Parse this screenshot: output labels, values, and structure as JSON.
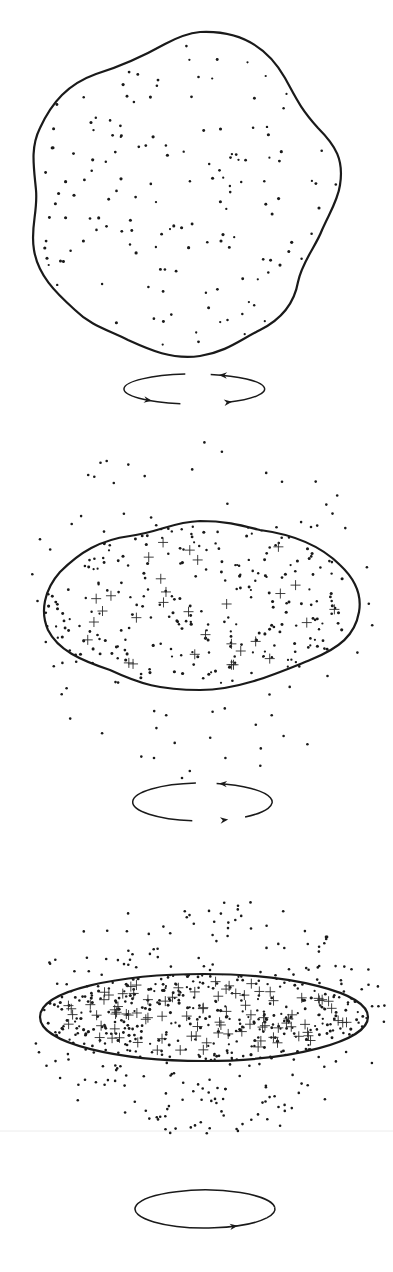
{
  "figure": {
    "colors": {
      "ink": "#1a1a1a",
      "background": "#ffffff",
      "seam": "#ececec"
    },
    "seam_line_y": 1131,
    "stages": [
      {
        "id": "stage-1",
        "label": "irregular rotating cloud",
        "outline_path": "M 200 32 C 240 30 268 48 285 78 C 296 98 300 108 318 128 C 336 146 344 160 340 185 C 338 200 330 212 322 230 C 316 246 302 262 298 282 C 294 305 280 320 260 330 C 240 340 226 352 200 356 C 172 360 150 350 128 340 C 108 330 90 325 75 310 C 55 292 38 275 34 250 C 30 228 38 212 36 190 C 34 168 30 148 40 128 C 52 102 68 84 96 74 C 122 66 140 58 165 44 C 178 37 190 33 200 32 Z",
        "dots": {
          "count": 190,
          "cx": 188,
          "cy": 192,
          "rx": 150,
          "ry": 160,
          "seed": 11,
          "clip": "stage-1"
        },
        "crosses": {
          "count": 0
        },
        "halo": {
          "count": 0
        },
        "rotation": {
          "cx": 195,
          "cy": 389,
          "rx": 70,
          "ry": 15,
          "arrows": [
            "left-top",
            "bottom-left",
            "bottom-right"
          ]
        }
      },
      {
        "id": "stage-2",
        "label": "flattening cloud with forming stars",
        "outline_path": "M 200 521 C 225 521 240 525 260 530 C 290 534 320 545 340 565 C 356 580 362 595 359 612 C 355 635 340 648 310 660 C 280 672 240 690 200 690 C 160 690 140 684 110 670 C 80 660 58 650 48 630 C 40 612 44 590 60 572 C 80 552 100 540 130 536 C 160 532 172 522 200 521 Z",
        "dots": {
          "count": 330,
          "cx": 202,
          "cy": 605,
          "rx": 158,
          "ry": 82,
          "seed": 23,
          "clip": "stage-2"
        },
        "crosses": {
          "count": 30,
          "cx": 202,
          "cy": 605,
          "rx": 140,
          "ry": 70,
          "seed": 7,
          "size": 5
        },
        "halo": {
          "count": 70,
          "cx": 202,
          "cy": 605,
          "rx": 135,
          "ry": 175,
          "seed": 41
        },
        "rotation": {
          "cx": 202,
          "cy": 802,
          "rx": 70,
          "ry": 19,
          "arrows": [
            "top",
            "bottom"
          ]
        }
      },
      {
        "id": "stage-3",
        "label": "thin rotating disk",
        "outline_path": "M 40 1017 C 40 990 120 974 204 974 C 290 974 368 992 368 1017 C 368 1042 290 1061 204 1061 C 120 1061 40 1044 40 1017 Z",
        "dots": {
          "count": 420,
          "cx": 204,
          "cy": 1017,
          "rx": 164,
          "ry": 43,
          "seed": 59,
          "clip": "stage-3"
        },
        "crosses": {
          "count": 90,
          "cx": 204,
          "cy": 1017,
          "rx": 150,
          "ry": 36,
          "seed": 13,
          "size": 5
        },
        "halo": {
          "count": 200,
          "cx": 204,
          "cy": 1017,
          "rx": 150,
          "ry": 120,
          "seed": 77
        },
        "rotation": {
          "cx": 205,
          "cy": 1209,
          "rx": 70,
          "ry": 19,
          "arrows": [
            "bottom"
          ]
        }
      }
    ]
  }
}
